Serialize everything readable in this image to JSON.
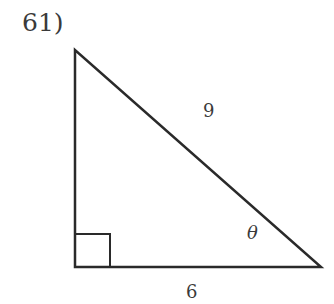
{
  "problem": {
    "number": "61)"
  },
  "triangle": {
    "hypotenuse_label": "9",
    "base_label": "6",
    "angle_label": "θ",
    "right_angle": true,
    "stroke_color": "#2a2a2a"
  }
}
